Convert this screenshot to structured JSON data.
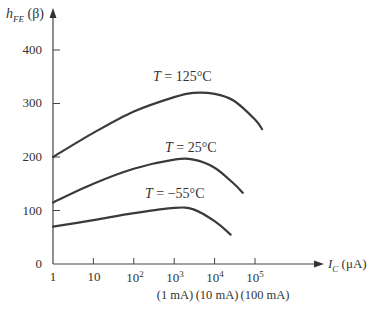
{
  "chart_data": {
    "type": "line",
    "title": "",
    "ylabel": "h_FE (β)",
    "xlabel": "I_C (μA)",
    "xscale": "log",
    "xlim": [
      1,
      300000
    ],
    "ylim": [
      0,
      430
    ],
    "y_ticks": [
      0,
      100,
      200,
      300,
      400
    ],
    "x_ticks": [
      "1",
      "10",
      "10^2",
      "10^3",
      "10^4",
      "10^5"
    ],
    "x_sublabels": [
      {
        "at": "10^3",
        "text": "(1 mA)"
      },
      {
        "at": "10^4",
        "text": "(10 mA)"
      },
      {
        "at": "10^5",
        "text": "(100 mA)"
      }
    ],
    "grid": false,
    "legend": "inline labels",
    "series": [
      {
        "name": "T = 125°C",
        "x": [
          1,
          10,
          100,
          1000,
          3000,
          10000,
          30000,
          100000,
          150000
        ],
        "y": [
          200,
          245,
          285,
          312,
          320,
          318,
          305,
          270,
          252
        ]
      },
      {
        "name": "T = 25°C",
        "x": [
          1,
          10,
          100,
          1000,
          3000,
          10000,
          30000,
          50000
        ],
        "y": [
          115,
          150,
          178,
          195,
          195,
          180,
          150,
          133
        ]
      },
      {
        "name": "T = −55°C",
        "x": [
          1,
          10,
          100,
          1000,
          3000,
          10000,
          25000
        ],
        "y": [
          70,
          82,
          95,
          105,
          102,
          80,
          55
        ]
      }
    ]
  },
  "labels": {
    "ylabel_main": "h",
    "ylabel_sub": "FE",
    "ylabel_rest": " (β)",
    "xlabel_main": "I",
    "xlabel_sub": "C",
    "xlabel_rest": " (μA)",
    "yticks": [
      "400",
      "300",
      "200",
      "100",
      "0"
    ],
    "xticks": [
      "1",
      "10",
      "10",
      "10",
      "10",
      "10"
    ],
    "xtick_exps": [
      "",
      "",
      "2",
      "3",
      "4",
      "5"
    ],
    "subs": [
      "(1 mA)",
      "(10 mA)",
      "(100 mA)"
    ],
    "curve_labels": [
      {
        "var": "T",
        "eq": " = 125°C"
      },
      {
        "var": "T",
        "eq": " = 25°C"
      },
      {
        "var": "T",
        "eq": " = −55°C"
      }
    ]
  }
}
